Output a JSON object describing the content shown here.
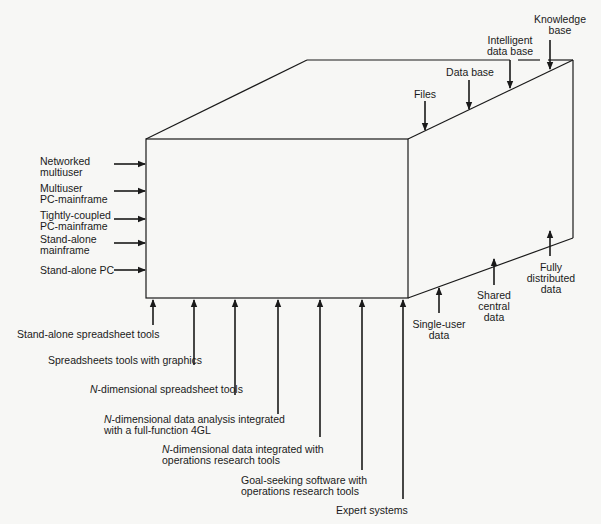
{
  "diagram": {
    "type": "3d-cube-framework",
    "left_axis": {
      "labels": [
        {
          "line1": "Networked",
          "line2": "multiuser"
        },
        {
          "line1": "Multiuser",
          "line2": "PC-mainframe"
        },
        {
          "line1": "Tightly-coupled",
          "line2": "PC-mainframe"
        },
        {
          "line1": "Stand-alone",
          "line2": "mainframe"
        },
        {
          "line1": "Stand-alone PC",
          "line2": ""
        }
      ]
    },
    "top_axis": {
      "labels": [
        {
          "line1": "Files",
          "line2": ""
        },
        {
          "line1": "Data base",
          "line2": ""
        },
        {
          "line1": "Intelligent",
          "line2": "data base"
        },
        {
          "line1": "Knowledge",
          "line2": "base"
        }
      ]
    },
    "right_axis": {
      "labels": [
        {
          "line1": "Single-user",
          "line2": "data",
          "line3": ""
        },
        {
          "line1": "Shared",
          "line2": "central",
          "line3": "data"
        },
        {
          "line1": "Fully",
          "line2": "distributed",
          "line3": "data"
        }
      ]
    },
    "bottom_axis": {
      "labels": [
        {
          "prefix": "",
          "line1": "Stand-alone spreadsheet tools",
          "line2": ""
        },
        {
          "prefix": "",
          "line1": "Spreadsheets tools with graphics",
          "line2": ""
        },
        {
          "prefix": "N",
          "line1": "-dimensional spreadsheet tools",
          "line2": ""
        },
        {
          "prefix": "N",
          "line1": "-dimensional data analysis integrated",
          "line2": "with a full-function 4GL"
        },
        {
          "prefix": "N",
          "line1": "-dimensional data integrated with",
          "line2": "operations research tools"
        },
        {
          "prefix": "",
          "line1": "Goal-seeking software with",
          "line2": "operations research tools"
        },
        {
          "prefix": "",
          "line1": "Expert systems",
          "line2": ""
        }
      ]
    },
    "colors": {
      "line": "#1a1a1a",
      "background": "#f7f7f5"
    }
  }
}
